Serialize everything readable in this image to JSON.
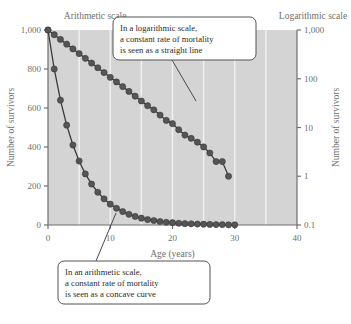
{
  "figure": {
    "left_scale_title": "Arithmetic scale",
    "right_scale_title": "Logarithmic scale",
    "background_color": "#d4d4d4",
    "gridline_color": "#f2f2f2",
    "marker_color": "#555555",
    "line_color": "#3a3a3a",
    "axis_color": "#6f6f6f"
  },
  "callouts": [
    {
      "id": "log-callout",
      "lines": [
        "In a logarithmic scale,",
        "a constant rate of mortality",
        "is seen as a straight line"
      ]
    },
    {
      "id": "arith-callout",
      "lines": [
        "In an arithmetic scale,",
        "a constant rate of mortality",
        "is seen as a concave curve"
      ]
    }
  ],
  "chart_data": {
    "type": "line",
    "title": "",
    "xlabel": "Age (years)",
    "ylabel_left": "Number of survivors",
    "ylabel_right": "Number of survivors",
    "xlim": [
      0,
      40
    ],
    "xticks": [
      0,
      10,
      20,
      30,
      40
    ],
    "xticklabels": [
      "0",
      "10",
      "20",
      "30",
      "40"
    ],
    "grid": "vertical gridlines every 5 years",
    "gridlines_x": [
      5,
      10,
      15,
      20,
      25,
      30,
      35
    ],
    "left_axis": {
      "scale": "linear",
      "ylim": [
        0,
        1000
      ],
      "yticks": [
        0,
        200,
        400,
        600,
        800,
        1000
      ],
      "yticklabels": [
        "0",
        "200",
        "400",
        "600",
        "800",
        "1,000"
      ]
    },
    "right_axis": {
      "scale": "log",
      "ylim": [
        0.1,
        1000
      ],
      "yticks": [
        0.1,
        1,
        10,
        100,
        1000
      ],
      "yticklabels": [
        "0.1",
        "1",
        "10",
        "100",
        "1,000"
      ]
    },
    "legend": "none",
    "annotations": [
      "In a logarithmic scale, a constant rate of mortality is seen as a straight line",
      "In an arithmetic scale, a constant rate of mortality is seen as a concave curve"
    ],
    "series": [
      {
        "name": "Survivors plotted on arithmetic scale",
        "axis": "left",
        "style": "line with filled circle markers",
        "x": [
          0,
          1,
          2,
          3,
          4,
          5,
          6,
          7,
          8,
          9,
          10,
          11,
          12,
          13,
          14,
          15,
          16,
          17,
          18,
          19,
          20,
          21,
          22,
          23,
          24,
          25,
          26,
          27,
          28,
          29,
          30
        ],
        "values": [
          1000,
          800,
          640,
          512,
          410,
          328,
          262,
          210,
          168,
          134,
          107,
          86,
          69,
          55,
          44,
          35,
          28,
          23,
          18,
          14,
          12,
          9,
          7,
          6,
          5,
          4,
          3,
          2,
          2,
          1,
          1
        ]
      },
      {
        "name": "Survivors plotted on logarithmic scale",
        "axis": "right",
        "style": "line with filled circle markers",
        "x": [
          0,
          1,
          2,
          3,
          4,
          5,
          6,
          7,
          8,
          9,
          10,
          11,
          12,
          13,
          14,
          15,
          16,
          17,
          18,
          19,
          20,
          21,
          22,
          23,
          24,
          25,
          26,
          27,
          28,
          29
        ],
        "values": [
          1000,
          800,
          640,
          512,
          410,
          328,
          262,
          210,
          168,
          134,
          107,
          86,
          69,
          55,
          44,
          35,
          28,
          23,
          18,
          14,
          12,
          9,
          7,
          6,
          5,
          4,
          3,
          2,
          2,
          1
        ]
      }
    ]
  }
}
